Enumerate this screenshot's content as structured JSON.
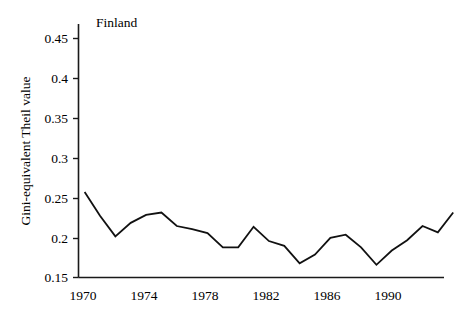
{
  "chart_data": {
    "type": "line",
    "title": "Finland",
    "title_position": "inside-top-left",
    "xlabel": "",
    "ylabel": "Gini-equivalent Theil value",
    "xlim": [
      1969.6,
      1993.4
    ],
    "ylim": [
      0.15,
      0.47
    ],
    "grid": false,
    "legend": null,
    "xticks": [
      1970,
      1974,
      1978,
      1982,
      1986,
      1990
    ],
    "xtick_labels": [
      "1970",
      "1974",
      "1978",
      "1982",
      "1986",
      "1990"
    ],
    "yticks": [
      0.15,
      0.2,
      0.25,
      0.3,
      0.35,
      0.4,
      0.45
    ],
    "ytick_labels": [
      "0.15",
      "0.2",
      "0.25",
      "0.3",
      "0.35",
      "0.4",
      "0.45"
    ],
    "x": [
      1970,
      1971,
      1972,
      1973,
      1974,
      1975,
      1976,
      1977,
      1978,
      1979,
      1980,
      1981,
      1982,
      1983,
      1984,
      1985,
      1986,
      1987,
      1988,
      1989,
      1990,
      1991,
      1992,
      1993
    ],
    "series": [
      {
        "name": "Finland",
        "color": "#111111",
        "values": [
          0.258,
          0.228,
          0.202,
          0.219,
          0.229,
          0.232,
          0.215,
          0.211,
          0.206,
          0.188,
          0.188,
          0.214,
          0.196,
          0.19,
          0.168,
          0.179,
          0.2,
          0.204,
          0.188,
          0.166,
          0.184,
          0.197,
          0.215,
          0.207
        ]
      }
    ],
    "final_value": 0.232
  },
  "panel": {
    "title": "Finland",
    "y_axis_title": "Gini-equivalent Theil value"
  },
  "colors": {
    "line": "#111111",
    "axis": "#1a1a1a",
    "background": "#ffffff"
  }
}
